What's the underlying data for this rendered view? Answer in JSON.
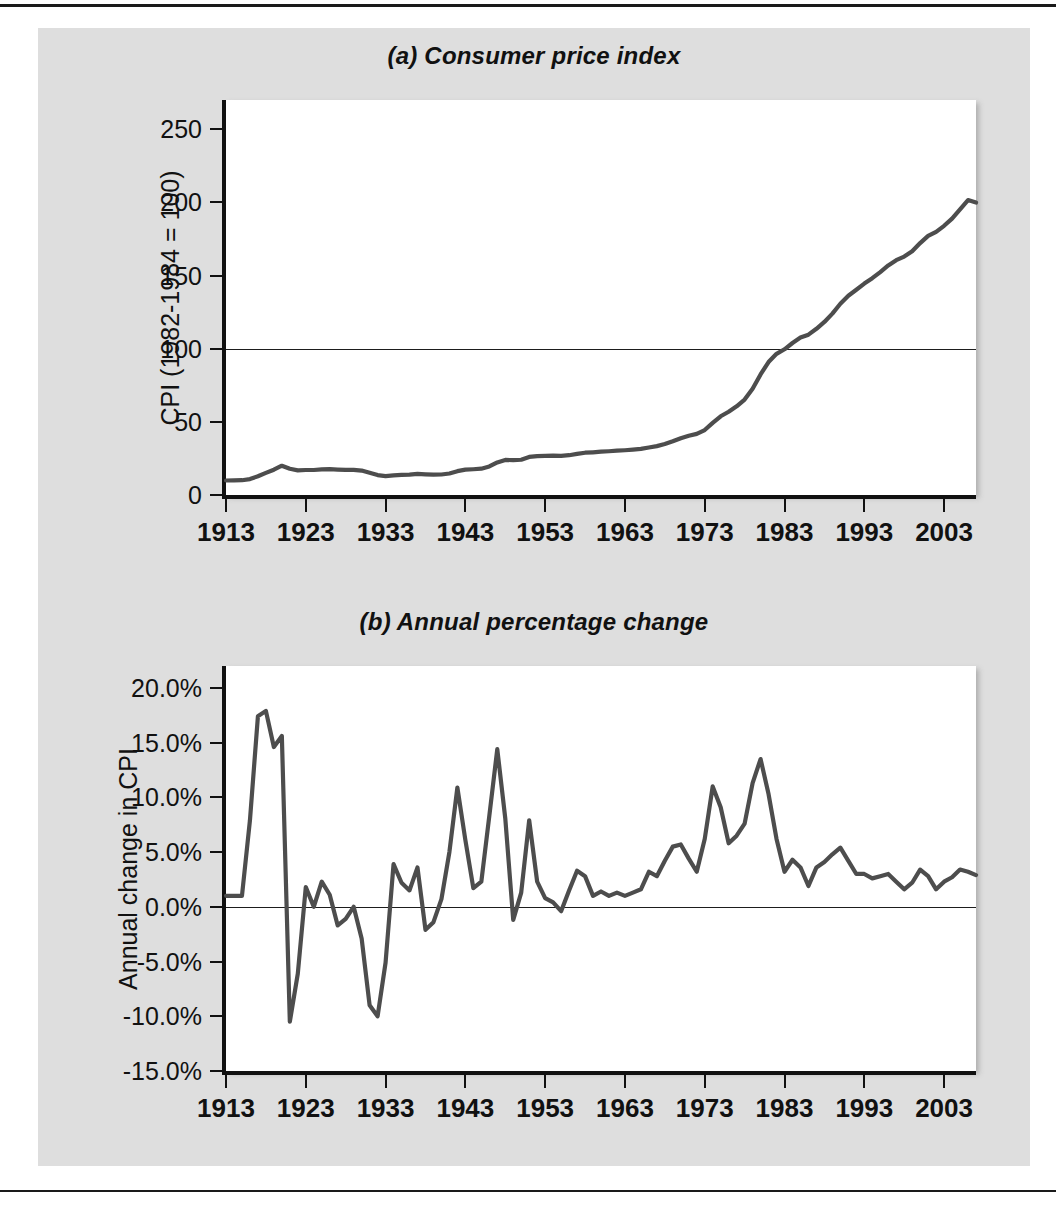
{
  "figure": {
    "charts": [
      {
        "id": "consumer-price-index",
        "title": "(a) Consumer price index",
        "ylabel": "CPI (1982-1984 = 100)",
        "yticks": [
          "0",
          "50",
          "100",
          "150",
          "200",
          "250"
        ],
        "xticks": [
          "1913",
          "1923",
          "1933",
          "1943",
          "1953",
          "1963",
          "1973",
          "1983",
          "1993",
          "2003"
        ]
      },
      {
        "id": "annual-percentage-change",
        "title": "(b) Annual percentage change",
        "ylabel": "Annual change in CPI",
        "yticks": [
          "-15.0%",
          "-10.0%",
          "-5.0%",
          "0.0%",
          "5.0%",
          "10.0%",
          "15.0%",
          "20.0%"
        ],
        "xticks": [
          "1913",
          "1923",
          "1933",
          "1943",
          "1953",
          "1963",
          "1973",
          "1983",
          "1993",
          "2003"
        ]
      }
    ]
  },
  "chart_data": [
    {
      "type": "line",
      "title": "(a) Consumer price index",
      "xlabel": "",
      "ylabel": "CPI (1982-1984 = 100)",
      "xlim": [
        1913,
        2007
      ],
      "ylim": [
        0,
        270
      ],
      "ytick_values": [
        0,
        50,
        100,
        150,
        200,
        250
      ],
      "xtick_values": [
        1913,
        1923,
        1933,
        1943,
        1953,
        1963,
        1973,
        1983,
        1993,
        2003
      ],
      "grid": false,
      "legend": "none",
      "reference_lines": [
        {
          "y": 100,
          "note": "CPI = 100 base period 1982-1984"
        }
      ],
      "line_color": "#4d4d4d",
      "x": [
        1913,
        1914,
        1915,
        1916,
        1917,
        1918,
        1919,
        1920,
        1921,
        1922,
        1923,
        1924,
        1925,
        1926,
        1927,
        1928,
        1929,
        1930,
        1931,
        1932,
        1933,
        1934,
        1935,
        1936,
        1937,
        1938,
        1939,
        1940,
        1941,
        1942,
        1943,
        1944,
        1945,
        1946,
        1947,
        1948,
        1949,
        1950,
        1951,
        1952,
        1953,
        1954,
        1955,
        1956,
        1957,
        1958,
        1959,
        1960,
        1961,
        1962,
        1963,
        1964,
        1965,
        1966,
        1967,
        1968,
        1969,
        1970,
        1971,
        1972,
        1973,
        1974,
        1975,
        1976,
        1977,
        1978,
        1979,
        1980,
        1981,
        1982,
        1983,
        1984,
        1985,
        1986,
        1987,
        1988,
        1989,
        1990,
        1991,
        1992,
        1993,
        1994,
        1995,
        1996,
        1997,
        1998,
        1999,
        2000,
        2001,
        2002,
        2003,
        2004,
        2005,
        2006,
        2007
      ],
      "y": [
        9.9,
        10.0,
        10.1,
        10.9,
        12.8,
        15.1,
        17.3,
        20.0,
        17.9,
        16.8,
        17.1,
        17.1,
        17.5,
        17.7,
        17.4,
        17.2,
        17.2,
        16.7,
        15.2,
        13.6,
        12.9,
        13.4,
        13.7,
        13.9,
        14.4,
        14.1,
        13.9,
        14.0,
        14.7,
        16.3,
        17.3,
        17.6,
        18.0,
        19.5,
        22.3,
        24.0,
        23.8,
        24.1,
        26.0,
        26.6,
        26.8,
        26.9,
        26.8,
        27.2,
        28.1,
        28.9,
        29.2,
        29.6,
        29.9,
        30.3,
        30.6,
        31.0,
        31.5,
        32.5,
        33.4,
        34.8,
        36.7,
        38.8,
        40.5,
        41.8,
        44.4,
        49.3,
        53.8,
        56.9,
        60.6,
        65.2,
        72.6,
        82.4,
        90.9,
        96.5,
        99.6,
        103.9,
        107.6,
        109.6,
        113.6,
        118.3,
        124.0,
        130.7,
        136.2,
        140.3,
        144.5,
        148.2,
        152.4,
        156.9,
        160.5,
        163.0,
        166.6,
        172.2,
        177.1,
        179.9,
        184.0,
        188.9,
        195.3,
        201.6,
        199.9
      ]
    },
    {
      "type": "line",
      "title": "(b) Annual percentage change",
      "xlabel": "",
      "ylabel": "Annual change in CPI",
      "xlim": [
        1913,
        2007
      ],
      "ylim": [
        -15.0,
        22.0
      ],
      "ytick_values": [
        -15.0,
        -10.0,
        -5.0,
        0.0,
        5.0,
        10.0,
        15.0,
        20.0
      ],
      "xtick_values": [
        1913,
        1923,
        1933,
        1943,
        1953,
        1963,
        1973,
        1983,
        1993,
        2003
      ],
      "grid": false,
      "legend": "none",
      "reference_lines": [
        {
          "y": 0,
          "note": "zero change"
        }
      ],
      "line_color": "#4d4d4d",
      "units": "percent",
      "x": [
        1913,
        1914,
        1915,
        1916,
        1917,
        1918,
        1919,
        1920,
        1921,
        1922,
        1923,
        1924,
        1925,
        1926,
        1927,
        1928,
        1929,
        1930,
        1931,
        1932,
        1933,
        1934,
        1935,
        1936,
        1937,
        1938,
        1939,
        1940,
        1941,
        1942,
        1943,
        1944,
        1945,
        1946,
        1947,
        1948,
        1949,
        1950,
        1951,
        1952,
        1953,
        1954,
        1955,
        1956,
        1957,
        1958,
        1959,
        1960,
        1961,
        1962,
        1963,
        1964,
        1965,
        1966,
        1967,
        1968,
        1969,
        1970,
        1971,
        1972,
        1973,
        1974,
        1975,
        1976,
        1977,
        1978,
        1979,
        1980,
        1981,
        1982,
        1983,
        1984,
        1985,
        1986,
        1987,
        1988,
        1989,
        1990,
        1991,
        1992,
        1993,
        1994,
        1995,
        1996,
        1997,
        1998,
        1999,
        2000,
        2001,
        2002,
        2003,
        2004,
        2005,
        2006,
        2007
      ],
      "y": [
        1.0,
        1.0,
        1.0,
        7.9,
        17.4,
        17.9,
        14.6,
        15.6,
        -10.5,
        -6.1,
        1.8,
        0.0,
        2.3,
        1.1,
        -1.7,
        -1.1,
        0.0,
        -2.9,
        -9.0,
        -10.0,
        -5.1,
        3.9,
        2.2,
        1.5,
        3.6,
        -2.1,
        -1.4,
        0.7,
        5.0,
        10.9,
        6.1,
        1.7,
        2.3,
        8.3,
        14.4,
        8.1,
        -1.2,
        1.3,
        7.9,
        2.3,
        0.8,
        0.4,
        -0.4,
        1.5,
        3.3,
        2.8,
        1.0,
        1.4,
        1.0,
        1.3,
        1.0,
        1.3,
        1.6,
        3.2,
        2.8,
        4.2,
        5.5,
        5.7,
        4.4,
        3.2,
        6.2,
        11.0,
        9.1,
        5.8,
        6.5,
        7.6,
        11.3,
        13.5,
        10.3,
        6.2,
        3.2,
        4.3,
        3.6,
        1.9,
        3.6,
        4.1,
        4.8,
        5.4,
        4.2,
        3.0,
        3.0,
        2.6,
        2.8,
        3.0,
        2.3,
        1.6,
        2.2,
        3.4,
        2.8,
        1.6,
        2.3,
        2.7,
        3.4,
        3.2,
        2.9
      ]
    }
  ]
}
